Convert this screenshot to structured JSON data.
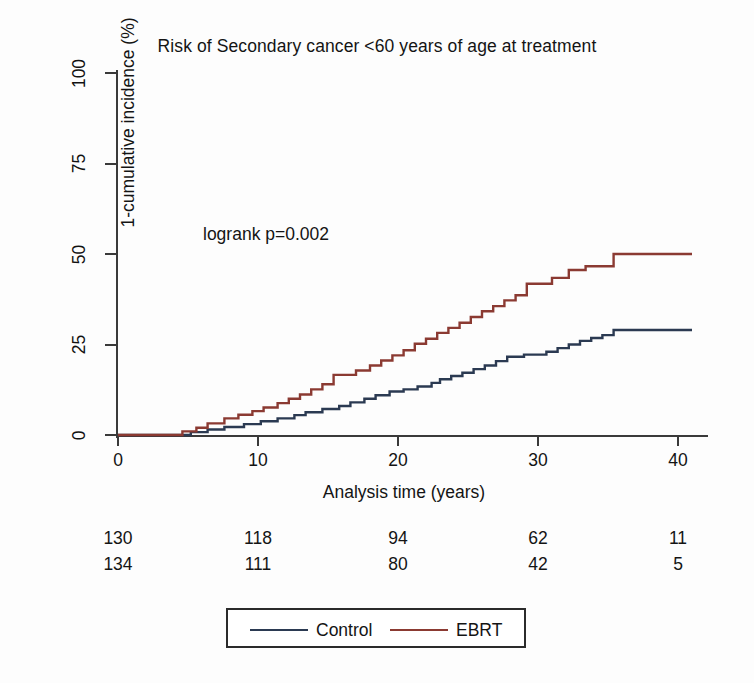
{
  "chart_data": {
    "type": "line",
    "title": "Risk of Secondary cancer <60 years of age at treatment",
    "xlabel": "Analysis time (years)",
    "ylabel": "1-cumulative incidence (%)",
    "xlim": [
      0,
      43
    ],
    "ylim": [
      0,
      100
    ],
    "xticks": [
      0,
      10,
      20,
      30,
      40
    ],
    "yticks": [
      0,
      25,
      50,
      75,
      100
    ],
    "grid": false,
    "annotation": "logrank p=0.002",
    "legend_position": "bottom",
    "series": [
      {
        "name": "Control",
        "color": "#2b3a52",
        "final_value": 29,
        "points": [
          [
            0,
            0
          ],
          [
            5.2,
            0
          ],
          [
            5.2,
            0.8
          ],
          [
            6.4,
            0.8
          ],
          [
            6.4,
            1.5
          ],
          [
            7.6,
            1.5
          ],
          [
            7.6,
            2.2
          ],
          [
            9.0,
            2.2
          ],
          [
            9.0,
            3.0
          ],
          [
            10.2,
            3.0
          ],
          [
            10.2,
            3.8
          ],
          [
            11.4,
            3.8
          ],
          [
            11.4,
            4.6
          ],
          [
            12.6,
            4.6
          ],
          [
            12.6,
            5.5
          ],
          [
            13.4,
            5.5
          ],
          [
            13.4,
            6.3
          ],
          [
            14.6,
            6.3
          ],
          [
            14.6,
            7.2
          ],
          [
            15.8,
            7.2
          ],
          [
            15.8,
            8.0
          ],
          [
            16.6,
            8.0
          ],
          [
            16.6,
            9.0
          ],
          [
            17.6,
            9.0
          ],
          [
            17.6,
            10.0
          ],
          [
            18.4,
            10.0
          ],
          [
            18.4,
            11.0
          ],
          [
            19.4,
            11.0
          ],
          [
            19.4,
            12.0
          ],
          [
            20.4,
            12.0
          ],
          [
            20.4,
            12.6
          ],
          [
            21.4,
            12.6
          ],
          [
            21.4,
            13.4
          ],
          [
            22.4,
            13.4
          ],
          [
            22.4,
            14.4
          ],
          [
            23.0,
            14.4
          ],
          [
            23.0,
            15.4
          ],
          [
            23.8,
            15.4
          ],
          [
            23.8,
            16.3
          ],
          [
            24.6,
            16.3
          ],
          [
            24.6,
            17.2
          ],
          [
            25.4,
            17.2
          ],
          [
            25.4,
            18.2
          ],
          [
            26.2,
            18.2
          ],
          [
            26.2,
            19.2
          ],
          [
            27.0,
            19.2
          ],
          [
            27.0,
            20.4
          ],
          [
            27.8,
            20.4
          ],
          [
            27.8,
            21.6
          ],
          [
            29.0,
            21.6
          ],
          [
            29.0,
            22.2
          ],
          [
            30.6,
            22.2
          ],
          [
            30.6,
            23.0
          ],
          [
            31.4,
            23.0
          ],
          [
            31.4,
            24.0
          ],
          [
            32.2,
            24.0
          ],
          [
            32.2,
            25.0
          ],
          [
            33.0,
            25.0
          ],
          [
            33.0,
            26.0
          ],
          [
            33.8,
            26.0
          ],
          [
            33.8,
            26.8
          ],
          [
            34.6,
            26.8
          ],
          [
            34.6,
            27.6
          ],
          [
            35.4,
            27.6
          ],
          [
            35.4,
            29.0
          ],
          [
            41.0,
            29.0
          ]
        ]
      },
      {
        "name": "EBRT",
        "color": "#8b3a32",
        "final_value": 50,
        "points": [
          [
            0,
            0
          ],
          [
            4.6,
            0
          ],
          [
            4.6,
            1.0
          ],
          [
            5.6,
            1.0
          ],
          [
            5.6,
            2.0
          ],
          [
            6.4,
            2.0
          ],
          [
            6.4,
            3.2
          ],
          [
            7.6,
            3.2
          ],
          [
            7.6,
            4.6
          ],
          [
            8.6,
            4.6
          ],
          [
            8.6,
            5.6
          ],
          [
            9.6,
            5.6
          ],
          [
            9.6,
            6.6
          ],
          [
            10.4,
            6.6
          ],
          [
            10.4,
            7.6
          ],
          [
            11.4,
            7.6
          ],
          [
            11.4,
            8.8
          ],
          [
            12.2,
            8.8
          ],
          [
            12.2,
            10.0
          ],
          [
            13.0,
            10.0
          ],
          [
            13.0,
            11.2
          ],
          [
            13.8,
            11.2
          ],
          [
            13.8,
            12.6
          ],
          [
            14.6,
            12.6
          ],
          [
            14.6,
            14.0
          ],
          [
            15.4,
            14.0
          ],
          [
            15.4,
            16.6
          ],
          [
            17.0,
            16.6
          ],
          [
            17.0,
            17.8
          ],
          [
            18.0,
            17.8
          ],
          [
            18.0,
            19.2
          ],
          [
            18.8,
            19.2
          ],
          [
            18.8,
            20.6
          ],
          [
            19.6,
            20.6
          ],
          [
            19.6,
            22.0
          ],
          [
            20.4,
            22.0
          ],
          [
            20.4,
            23.4
          ],
          [
            21.2,
            23.4
          ],
          [
            21.2,
            25.2
          ],
          [
            22.0,
            25.2
          ],
          [
            22.0,
            26.6
          ],
          [
            22.8,
            26.6
          ],
          [
            22.8,
            28.2
          ],
          [
            23.6,
            28.2
          ],
          [
            23.6,
            29.6
          ],
          [
            24.4,
            29.6
          ],
          [
            24.4,
            31.0
          ],
          [
            25.2,
            31.0
          ],
          [
            25.2,
            32.6
          ],
          [
            26.0,
            32.6
          ],
          [
            26.0,
            34.2
          ],
          [
            26.8,
            34.2
          ],
          [
            26.8,
            35.6
          ],
          [
            27.6,
            35.6
          ],
          [
            27.6,
            37.2
          ],
          [
            28.4,
            37.2
          ],
          [
            28.4,
            38.6
          ],
          [
            29.2,
            38.6
          ],
          [
            29.2,
            41.8
          ],
          [
            31.0,
            41.8
          ],
          [
            31.0,
            43.4
          ],
          [
            32.2,
            43.4
          ],
          [
            32.2,
            45.6
          ],
          [
            33.4,
            45.6
          ],
          [
            33.4,
            46.6
          ],
          [
            35.4,
            46.6
          ],
          [
            35.4,
            50.0
          ],
          [
            41.0,
            50.0
          ]
        ]
      }
    ]
  },
  "risk_table": {
    "times": [
      0,
      10,
      20,
      30,
      40
    ],
    "rows": [
      {
        "group": "Control",
        "counts": [
          130,
          118,
          94,
          62,
          11
        ]
      },
      {
        "group": "EBRT",
        "counts": [
          134,
          111,
          80,
          42,
          5
        ]
      }
    ]
  },
  "legend": {
    "entries": [
      {
        "label": "Control",
        "color": "#2b3a52"
      },
      {
        "label": "EBRT",
        "color": "#8b3a32"
      }
    ]
  },
  "axis_ticks": {
    "x_labels": [
      "0",
      "10",
      "20",
      "30",
      "40"
    ],
    "y_labels": [
      "0",
      "25",
      "50",
      "75",
      "100"
    ]
  }
}
